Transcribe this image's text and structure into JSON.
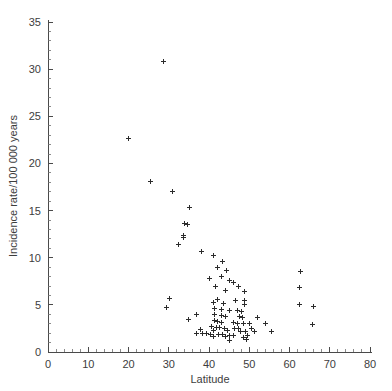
{
  "chart_data": {
    "type": "scatter",
    "title": "",
    "xlabel": "Latitude",
    "ylabel": "Incidence rate/100 000 years",
    "xlim": [
      0,
      80
    ],
    "ylim": [
      0,
      35
    ],
    "xticks": [
      0,
      10,
      20,
      30,
      40,
      50,
      60,
      70,
      80
    ],
    "yticks": [
      0,
      5,
      10,
      15,
      20,
      25,
      30,
      35
    ],
    "xtick_labels": [
      "0",
      "10",
      "20",
      "30",
      "40",
      "50",
      "60",
      "70",
      "80"
    ],
    "ytick_labels": [
      "0",
      "5",
      "10",
      "15",
      "20",
      "25",
      "30",
      "35"
    ],
    "x_minor_tick_interval": 2,
    "y_minor_tick_interval": 1,
    "grid": false,
    "legend": null,
    "marker_symbol": "plus",
    "marker_color": "#2b2b2b",
    "series": [
      {
        "name": "Incidence rate by latitude",
        "points": [
          [
            28.6,
            30.8
          ],
          [
            20.0,
            22.6
          ],
          [
            25.4,
            18.1
          ],
          [
            31.0,
            17.0
          ],
          [
            35.2,
            15.3
          ],
          [
            34.0,
            13.6
          ],
          [
            34.6,
            13.5
          ],
          [
            33.6,
            12.4
          ],
          [
            33.6,
            12.1
          ],
          [
            32.4,
            11.4
          ],
          [
            38.2,
            10.7
          ],
          [
            41.0,
            10.2
          ],
          [
            43.4,
            9.6
          ],
          [
            42.2,
            9.0
          ],
          [
            44.3,
            8.6
          ],
          [
            62.8,
            8.5
          ],
          [
            43.0,
            8.0
          ],
          [
            40.1,
            7.8
          ],
          [
            45.0,
            7.6
          ],
          [
            46.0,
            7.4
          ],
          [
            41.5,
            7.0
          ],
          [
            47.4,
            6.9
          ],
          [
            62.6,
            6.8
          ],
          [
            44.0,
            6.5
          ],
          [
            48.8,
            6.4
          ],
          [
            30.2,
            5.7
          ],
          [
            42.0,
            5.6
          ],
          [
            46.6,
            5.5
          ],
          [
            48.8,
            5.5
          ],
          [
            41.2,
            5.2
          ],
          [
            43.6,
            5.1
          ],
          [
            48.7,
            5.0
          ],
          [
            62.5,
            5.0
          ],
          [
            66.0,
            4.8
          ],
          [
            29.5,
            4.7
          ],
          [
            41.3,
            4.6
          ],
          [
            43.0,
            4.5
          ],
          [
            45.0,
            4.4
          ],
          [
            47.2,
            4.4
          ],
          [
            48.0,
            4.3
          ],
          [
            36.8,
            4.0
          ],
          [
            41.3,
            4.0
          ],
          [
            43.2,
            3.9
          ],
          [
            44.0,
            3.8
          ],
          [
            47.6,
            3.8
          ],
          [
            48.2,
            3.7
          ],
          [
            52.0,
            3.7
          ],
          [
            35.0,
            3.4
          ],
          [
            41.4,
            3.3
          ],
          [
            42.0,
            3.2
          ],
          [
            43.2,
            3.1
          ],
          [
            46.0,
            3.1
          ],
          [
            47.0,
            3.0
          ],
          [
            48.5,
            3.0
          ],
          [
            50.0,
            3.0
          ],
          [
            54.0,
            3.0
          ],
          [
            65.6,
            2.9
          ],
          [
            40.6,
            2.7
          ],
          [
            41.8,
            2.6
          ],
          [
            42.6,
            2.6
          ],
          [
            43.8,
            2.5
          ],
          [
            46.4,
            2.5
          ],
          [
            47.4,
            2.5
          ],
          [
            50.6,
            2.5
          ],
          [
            38.0,
            2.4
          ],
          [
            41.0,
            2.3
          ],
          [
            44.6,
            2.3
          ],
          [
            47.8,
            2.2
          ],
          [
            49.0,
            2.2
          ],
          [
            51.2,
            2.2
          ],
          [
            55.5,
            2.2
          ],
          [
            37.0,
            2.0
          ],
          [
            38.4,
            2.0
          ],
          [
            39.4,
            2.0
          ],
          [
            40.4,
            1.9
          ],
          [
            42.4,
            1.9
          ],
          [
            43.4,
            1.9
          ],
          [
            45.2,
            1.8
          ],
          [
            46.2,
            1.8
          ],
          [
            49.6,
            1.8
          ],
          [
            41.0,
            1.6
          ],
          [
            44.2,
            1.6
          ],
          [
            48.6,
            1.5
          ],
          [
            49.4,
            1.3
          ],
          [
            45.0,
            1.2
          ]
        ]
      }
    ]
  },
  "geometry": {
    "plot_x0_px": 48,
    "plot_y0_px": 352,
    "px_per_x_unit": 4.025,
    "px_per_y_unit": 9.428,
    "marker_arm_px": 2.5
  }
}
